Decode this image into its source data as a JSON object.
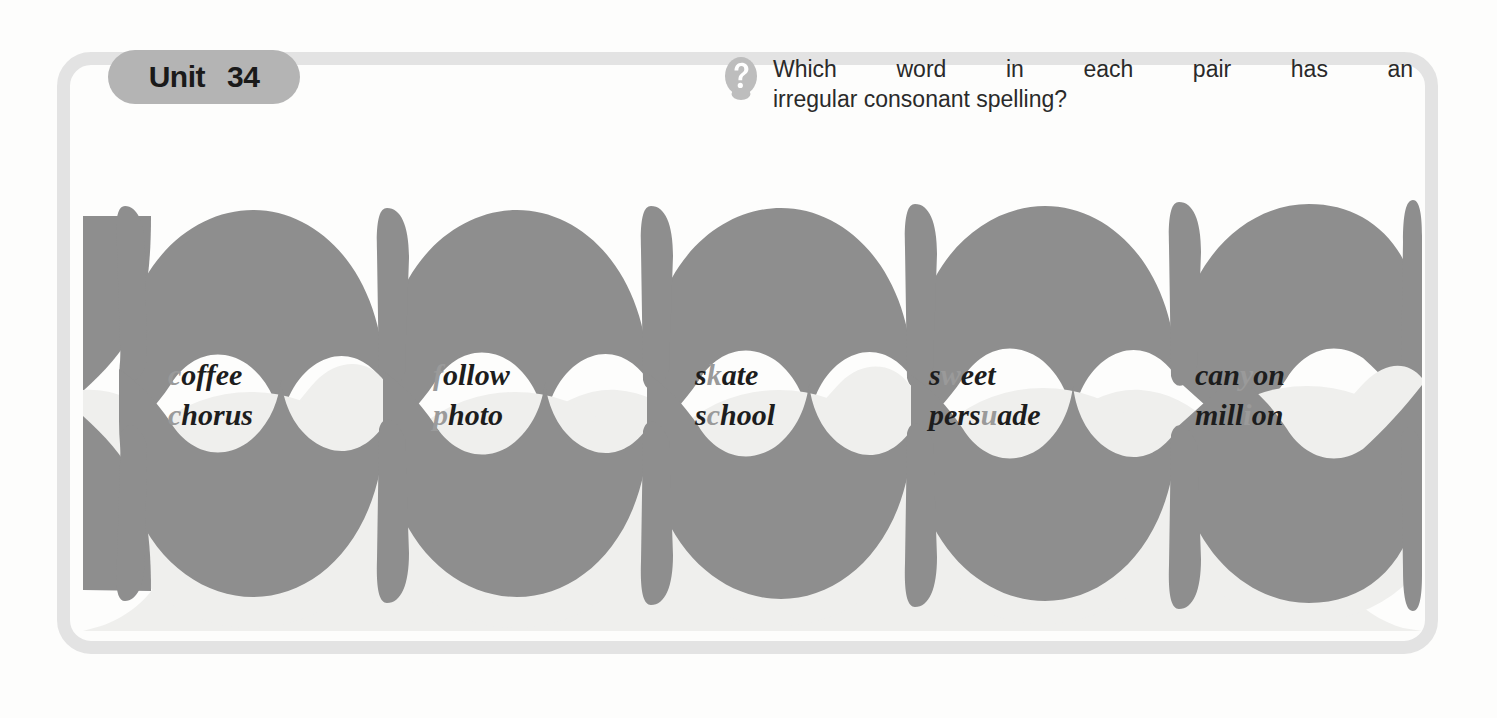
{
  "unit": {
    "word_label": "Unit",
    "number": "34"
  },
  "question": {
    "icon": "question-mark-circle-icon",
    "line1_words": [
      "Which",
      "word",
      "in",
      "each",
      "pair",
      "has",
      "an"
    ],
    "line2": "irregular consonant spelling?",
    "full_text": "Which word in each pair has an irregular consonant spelling?"
  },
  "colors": {
    "frame": "#e3e3e3",
    "pill_background": "#b4b4b4",
    "illustration_gray": "#8e8e8e",
    "illustration_light_band": "#efefed",
    "highlight_letter": "#1d1d1d",
    "muted_letter": "#9a9a9a",
    "page_background": "#fdfdfc"
  },
  "illustration": {
    "name": "apple-border-decoration",
    "motif": "apple",
    "repeat_count": 5
  },
  "word_pairs": [
    {
      "index": 1,
      "top": {
        "text": "coffee",
        "segments": [
          {
            "t": "c",
            "style": "muted"
          },
          {
            "t": "offee",
            "style": "highlight"
          }
        ]
      },
      "bottom": {
        "text": "chorus",
        "segments": [
          {
            "t": "c",
            "style": "muted"
          },
          {
            "t": "horus",
            "style": "highlight"
          }
        ]
      }
    },
    {
      "index": 2,
      "top": {
        "text": "follow",
        "segments": [
          {
            "t": "f",
            "style": "muted"
          },
          {
            "t": "ollow",
            "style": "highlight"
          }
        ]
      },
      "bottom": {
        "text": "photo",
        "segments": [
          {
            "t": "p",
            "style": "muted"
          },
          {
            "t": "hoto",
            "style": "highlight"
          }
        ]
      }
    },
    {
      "index": 3,
      "top": {
        "text": "skate",
        "segments": [
          {
            "t": "s",
            "style": "highlight"
          },
          {
            "t": "k",
            "style": "muted"
          },
          {
            "t": "ate",
            "style": "highlight"
          }
        ]
      },
      "bottom": {
        "text": "school",
        "segments": [
          {
            "t": "s",
            "style": "highlight"
          },
          {
            "t": "c",
            "style": "muted"
          },
          {
            "t": "hool",
            "style": "highlight"
          }
        ]
      }
    },
    {
      "index": 4,
      "top": {
        "text": "sweet",
        "segments": [
          {
            "t": "s",
            "style": "highlight"
          },
          {
            "t": "w",
            "style": "muted"
          },
          {
            "t": "eet",
            "style": "highlight"
          }
        ]
      },
      "bottom": {
        "text": "persuade",
        "segments": [
          {
            "t": "pers",
            "style": "highlight"
          },
          {
            "t": "u",
            "style": "muted"
          },
          {
            "t": "ade",
            "style": "highlight"
          }
        ]
      }
    },
    {
      "index": 5,
      "top": {
        "text": "canyon",
        "segments": [
          {
            "t": "can",
            "style": "highlight"
          },
          {
            "t": "y",
            "style": "muted"
          },
          {
            "t": "on",
            "style": "highlight"
          }
        ]
      },
      "bottom": {
        "text": "million",
        "segments": [
          {
            "t": "mill",
            "style": "highlight"
          },
          {
            "t": "i",
            "style": "muted"
          },
          {
            "t": "on",
            "style": "highlight"
          }
        ]
      }
    }
  ]
}
